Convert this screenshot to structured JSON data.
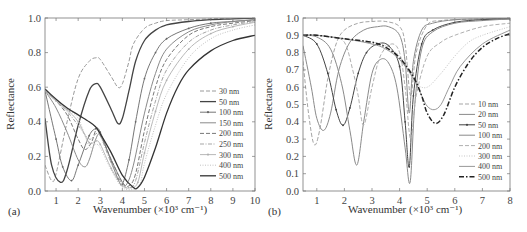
{
  "chart_data": [
    {
      "panel": "(a)",
      "type": "line",
      "xlabel": "Wavenumber (×10³ cm⁻¹)",
      "ylabel": "Reflectance",
      "xlim": [
        0.5,
        10
      ],
      "ylim": [
        0.0,
        1.0
      ],
      "xticks": [
        "1",
        "2",
        "3",
        "4",
        "5",
        "6",
        "7",
        "8",
        "9",
        "10"
      ],
      "yticks": [
        "0.0",
        "0.2",
        "0.4",
        "0.6",
        "0.8",
        "1.0"
      ],
      "legend_position": "lower right",
      "grid": false,
      "series": [
        {
          "name": "30 nm",
          "style": "dash",
          "color": "#9a9a9a",
          "width": 1.0,
          "x": [
            0.5,
            0.8,
            1.0,
            1.5,
            2.0,
            2.5,
            2.8,
            3.0,
            3.5,
            3.8,
            4.0,
            4.3,
            4.5,
            5.0,
            5.5,
            6.0,
            7.0,
            8.0,
            9.0,
            10.0
          ],
          "y": [
            0.15,
            0.06,
            0.1,
            0.4,
            0.65,
            0.75,
            0.77,
            0.76,
            0.66,
            0.6,
            0.62,
            0.75,
            0.85,
            0.94,
            0.97,
            0.985,
            0.99,
            0.995,
            1.0,
            1.0
          ]
        },
        {
          "name": "50 nm",
          "style": "solid",
          "color": "#444444",
          "width": 1.3,
          "x": [
            0.5,
            0.8,
            1.2,
            1.5,
            2.0,
            2.5,
            2.8,
            3.0,
            3.5,
            3.8,
            4.0,
            4.3,
            4.6,
            5.0,
            5.5,
            6.0,
            7.0,
            8.0,
            9.0,
            10.0
          ],
          "y": [
            0.42,
            0.15,
            0.05,
            0.12,
            0.38,
            0.58,
            0.62,
            0.6,
            0.47,
            0.39,
            0.42,
            0.58,
            0.75,
            0.87,
            0.93,
            0.96,
            0.98,
            0.99,
            0.995,
            1.0
          ]
        },
        {
          "name": "100 nm",
          "style": "dotmark",
          "color": "#666666",
          "width": 0.9,
          "x": [
            0.5,
            1.0,
            1.3,
            1.7,
            2.0,
            2.5,
            2.8,
            3.0,
            3.5,
            3.8,
            4.0,
            4.3,
            4.6,
            5.0,
            5.5,
            6.0,
            7.0,
            8.0,
            9.0,
            10.0
          ],
          "y": [
            0.58,
            0.3,
            0.14,
            0.06,
            0.15,
            0.32,
            0.36,
            0.34,
            0.17,
            0.07,
            0.04,
            0.18,
            0.4,
            0.65,
            0.8,
            0.88,
            0.94,
            0.97,
            0.98,
            0.99
          ]
        },
        {
          "name": "150 nm",
          "style": "solid",
          "color": "#8a8a8a",
          "width": 1.0,
          "x": [
            0.5,
            1.0,
            1.5,
            2.0,
            2.3,
            2.5,
            2.8,
            3.0,
            3.5,
            4.0,
            4.2,
            4.5,
            5.0,
            5.5,
            6.0,
            7.0,
            8.0,
            9.0,
            10.0
          ],
          "y": [
            0.58,
            0.48,
            0.34,
            0.18,
            0.14,
            0.18,
            0.3,
            0.32,
            0.18,
            0.05,
            0.04,
            0.15,
            0.45,
            0.68,
            0.82,
            0.92,
            0.96,
            0.98,
            0.99
          ]
        },
        {
          "name": "200 nm",
          "style": "dash",
          "color": "#777777",
          "width": 1.0,
          "x": [
            0.5,
            1.0,
            1.5,
            2.0,
            2.3,
            2.6,
            2.8,
            3.0,
            3.5,
            4.0,
            4.3,
            4.6,
            5.0,
            5.5,
            6.0,
            7.0,
            8.0,
            9.0,
            10.0
          ],
          "y": [
            0.58,
            0.52,
            0.44,
            0.3,
            0.24,
            0.28,
            0.35,
            0.33,
            0.18,
            0.05,
            0.03,
            0.1,
            0.35,
            0.6,
            0.76,
            0.9,
            0.95,
            0.97,
            0.985
          ]
        },
        {
          "name": "250 nm",
          "style": "dashdot",
          "color": "#a5a5a5",
          "width": 1.0,
          "x": [
            0.5,
            1.0,
            1.5,
            2.0,
            2.5,
            2.8,
            3.0,
            3.5,
            4.0,
            4.3,
            4.6,
            5.0,
            5.5,
            6.0,
            7.0,
            8.0,
            9.0,
            10.0
          ],
          "y": [
            0.58,
            0.52,
            0.46,
            0.38,
            0.3,
            0.33,
            0.32,
            0.16,
            0.04,
            0.02,
            0.06,
            0.28,
            0.52,
            0.7,
            0.86,
            0.93,
            0.96,
            0.98
          ]
        },
        {
          "name": "300 nm",
          "style": "dotmark",
          "color": "#b0b0b0",
          "width": 0.9,
          "x": [
            0.5,
            1.0,
            1.5,
            2.0,
            2.5,
            2.8,
            3.0,
            3.5,
            4.0,
            4.4,
            4.7,
            5.0,
            5.5,
            6.0,
            7.0,
            8.0,
            9.0,
            10.0
          ],
          "y": [
            0.58,
            0.52,
            0.47,
            0.4,
            0.28,
            0.29,
            0.27,
            0.13,
            0.03,
            0.02,
            0.05,
            0.22,
            0.46,
            0.64,
            0.82,
            0.91,
            0.95,
            0.975
          ]
        },
        {
          "name": "400 nm",
          "style": "dot",
          "color": "#c2c2c2",
          "width": 1.0,
          "x": [
            0.5,
            1.0,
            1.5,
            2.0,
            2.5,
            2.8,
            3.0,
            3.5,
            4.0,
            4.5,
            4.8,
            5.0,
            5.5,
            6.0,
            7.0,
            8.0,
            9.0,
            10.0
          ],
          "y": [
            0.58,
            0.52,
            0.47,
            0.42,
            0.26,
            0.27,
            0.25,
            0.12,
            0.02,
            0.01,
            0.04,
            0.16,
            0.38,
            0.56,
            0.77,
            0.88,
            0.93,
            0.96
          ]
        },
        {
          "name": "500 nm",
          "style": "solid",
          "color": "#333333",
          "width": 1.3,
          "x": [
            0.5,
            1.0,
            1.5,
            2.0,
            2.5,
            2.8,
            3.0,
            3.5,
            4.0,
            4.5,
            4.7,
            5.0,
            5.5,
            6.0,
            6.5,
            7.0,
            8.0,
            9.0,
            10.0
          ],
          "y": [
            0.59,
            0.53,
            0.48,
            0.44,
            0.4,
            0.37,
            0.33,
            0.22,
            0.09,
            0.02,
            0.02,
            0.08,
            0.25,
            0.45,
            0.6,
            0.7,
            0.81,
            0.87,
            0.9
          ]
        }
      ]
    },
    {
      "panel": "(b)",
      "type": "line",
      "xlabel": "Wavenumber (×10³ cm⁻¹)",
      "ylabel": "Reflectance",
      "xlim": [
        0.5,
        8
      ],
      "ylim": [
        0.0,
        1.0
      ],
      "xticks": [
        "1",
        "2",
        "3",
        "4",
        "5",
        "6",
        "7",
        "8"
      ],
      "yticks": [
        "0.0",
        "0.1",
        "0.2",
        "0.3",
        "0.4",
        "0.5",
        "0.6",
        "0.7",
        "0.8",
        "0.9",
        "1.0"
      ],
      "legend_position": "lower right",
      "grid": false,
      "series": [
        {
          "name": "10 nm",
          "style": "dash",
          "color": "#a5a5a5",
          "width": 1.0,
          "x": [
            0.5,
            0.7,
            0.9,
            1.1,
            1.4,
            1.7,
            2.0,
            2.5,
            3.0,
            3.5,
            4.0,
            4.2,
            4.4,
            4.6,
            5.0,
            5.5,
            6.0,
            7.0,
            8.0
          ],
          "y": [
            0.75,
            0.45,
            0.27,
            0.35,
            0.65,
            0.85,
            0.93,
            0.97,
            0.98,
            0.98,
            0.95,
            0.85,
            0.55,
            0.8,
            0.96,
            0.985,
            0.99,
            0.995,
            1.0
          ]
        },
        {
          "name": "20 nm",
          "style": "solid",
          "color": "#8a8a8a",
          "width": 1.0,
          "x": [
            0.5,
            0.8,
            1.0,
            1.25,
            1.5,
            1.8,
            2.2,
            2.7,
            3.2,
            3.6,
            4.0,
            4.2,
            4.35,
            4.5,
            4.8,
            5.2,
            6.0,
            7.0,
            8.0
          ],
          "y": [
            0.84,
            0.6,
            0.42,
            0.35,
            0.45,
            0.7,
            0.86,
            0.93,
            0.95,
            0.95,
            0.9,
            0.75,
            0.45,
            0.75,
            0.93,
            0.97,
            0.99,
            0.995,
            1.0
          ]
        },
        {
          "name": "50 nm",
          "style": "dotmark",
          "color": "#444444",
          "width": 1.0,
          "x": [
            0.5,
            1.0,
            1.4,
            1.7,
            1.95,
            2.2,
            2.5,
            2.8,
            3.2,
            3.6,
            4.0,
            4.2,
            4.35,
            4.5,
            4.8,
            5.2,
            6.0,
            7.0,
            8.0
          ],
          "y": [
            0.9,
            0.85,
            0.68,
            0.47,
            0.38,
            0.48,
            0.68,
            0.8,
            0.85,
            0.84,
            0.72,
            0.4,
            0.14,
            0.55,
            0.85,
            0.93,
            0.975,
            0.99,
            0.995
          ]
        },
        {
          "name": "100 nm",
          "style": "solid",
          "color": "#8a8a8a",
          "width": 1.0,
          "x": [
            0.5,
            1.0,
            1.5,
            1.9,
            2.2,
            2.45,
            2.7,
            3.0,
            3.3,
            3.6,
            3.9,
            4.2,
            4.38,
            4.55,
            4.8,
            5.2,
            6.0,
            7.0,
            8.0
          ],
          "y": [
            0.9,
            0.89,
            0.82,
            0.62,
            0.35,
            0.15,
            0.4,
            0.68,
            0.76,
            0.74,
            0.6,
            0.25,
            0.05,
            0.5,
            0.82,
            0.92,
            0.97,
            0.985,
            0.995
          ]
        },
        {
          "name": "200 nm",
          "style": "dash",
          "color": "#b0b0b0",
          "width": 1.0,
          "x": [
            0.5,
            1.0,
            1.5,
            2.0,
            2.3,
            2.5,
            2.7,
            3.0,
            3.3,
            3.7,
            4.0,
            4.2,
            4.4,
            4.6,
            5.0,
            5.5,
            6.0,
            7.0,
            8.0
          ],
          "y": [
            0.9,
            0.9,
            0.89,
            0.86,
            0.7,
            0.55,
            0.38,
            0.6,
            0.78,
            0.85,
            0.8,
            0.6,
            0.3,
            0.55,
            0.78,
            0.86,
            0.9,
            0.95,
            0.97
          ]
        },
        {
          "name": "300 nm",
          "style": "dot",
          "color": "#c5c5c5",
          "width": 1.0,
          "x": [
            0.5,
            1.0,
            1.5,
            2.0,
            2.5,
            3.0,
            3.5,
            4.0,
            4.3,
            4.6,
            5.0,
            5.5,
            6.0,
            6.5,
            7.0,
            8.0
          ],
          "y": [
            0.9,
            0.9,
            0.89,
            0.88,
            0.87,
            0.86,
            0.84,
            0.78,
            0.7,
            0.62,
            0.6,
            0.68,
            0.78,
            0.86,
            0.9,
            0.95
          ]
        },
        {
          "name": "400 nm",
          "style": "solid",
          "color": "#999999",
          "width": 1.0,
          "x": [
            0.5,
            1.0,
            2.0,
            3.0,
            3.5,
            4.0,
            4.5,
            4.8,
            5.0,
            5.25,
            5.5,
            5.8,
            6.2,
            7.0,
            8.0
          ],
          "y": [
            0.9,
            0.9,
            0.88,
            0.85,
            0.82,
            0.76,
            0.65,
            0.55,
            0.49,
            0.47,
            0.5,
            0.6,
            0.72,
            0.85,
            0.93
          ]
        },
        {
          "name": "500 nm",
          "style": "dashdotbold",
          "color": "#222222",
          "width": 1.5,
          "x": [
            0.5,
            1.0,
            2.0,
            3.0,
            3.5,
            4.0,
            4.5,
            4.8,
            5.0,
            5.3,
            5.6,
            6.0,
            6.5,
            7.0,
            7.5,
            8.0
          ],
          "y": [
            0.9,
            0.9,
            0.88,
            0.86,
            0.83,
            0.77,
            0.66,
            0.55,
            0.45,
            0.39,
            0.44,
            0.6,
            0.74,
            0.83,
            0.88,
            0.91
          ]
        }
      ]
    }
  ]
}
